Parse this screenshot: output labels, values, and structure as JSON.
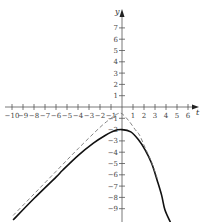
{
  "chart_data": {
    "type": "line",
    "title": "",
    "xlabel": "t",
    "ylabel": "y",
    "xlim": [
      -10,
      6.5
    ],
    "ylim": [
      -10,
      8
    ],
    "grid": false,
    "x_ticks": [
      -10,
      -9,
      -8,
      -7,
      -6,
      -5,
      -4,
      -3,
      -2,
      -1,
      1,
      2,
      3,
      4,
      5,
      6
    ],
    "y_ticks": [
      7,
      6,
      5,
      4,
      3,
      2,
      1,
      -1,
      -2,
      -3,
      -4,
      -5,
      -6,
      -7,
      -8,
      -9
    ],
    "series": [
      {
        "name": "solution curve",
        "style": "solid",
        "x": [
          -9.9,
          -8,
          -6,
          -5.4,
          -4,
          -2.6,
          -1.5,
          -0.7,
          0,
          0.8,
          1.5,
          2.1,
          2.7,
          3.2,
          3.6,
          3.9,
          4.4
        ],
        "y": [
          -10,
          -8.1,
          -6.2,
          -5.6,
          -4.3,
          -3.2,
          -2.5,
          -2.1,
          -2.0,
          -2.2,
          -2.9,
          -3.8,
          -5.0,
          -6.5,
          -7.8,
          -9.1,
          -10.2
        ]
      },
      {
        "name": "comparison curve",
        "style": "dashed",
        "x": [
          -9.9,
          -8,
          -6,
          -4,
          -2,
          -1,
          -0.4,
          0,
          0.6,
          1.2,
          1.6,
          2.1,
          2.7,
          3.2
        ],
        "y": [
          -9.6,
          -7.7,
          -5.7,
          -3.7,
          -1.8,
          -1.0,
          -0.6,
          -0.6,
          -1.2,
          -2.0,
          -2.5,
          -3.6,
          -4.9,
          -6.3
        ]
      }
    ]
  },
  "axes": {
    "x_label": "t",
    "y_label": "y",
    "x_tick_labels": [
      "−10",
      "−9",
      "−8",
      "−7",
      "−6",
      "−5",
      "−4",
      "−3",
      "−2",
      "−1",
      "1",
      "2",
      "3",
      "4",
      "5",
      "6"
    ],
    "y_tick_labels_pos": [
      "7",
      "6",
      "5",
      "4",
      "3",
      "2",
      "1"
    ],
    "y_tick_labels_neg": [
      "−1",
      "−2",
      "−3",
      "−4",
      "−5",
      "−6",
      "−7",
      "−8",
      "−9"
    ]
  },
  "colors": {
    "axis": "#555555",
    "solid_curve": "#111111",
    "dashed_curve": "#777777"
  }
}
